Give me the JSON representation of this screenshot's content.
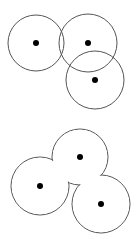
{
  "diagram": {
    "background": "#ffffff",
    "stroke_color": "#555555",
    "dot_color": "#000000",
    "top_figure": {
      "description": "three overlapping circles, each with a center dot",
      "circles": [
        {
          "cx": 36,
          "cy": 43,
          "r": 28
        },
        {
          "cx": 88,
          "cy": 43,
          "r": 29
        },
        {
          "cx": 95,
          "cy": 80,
          "r": 29
        }
      ]
    },
    "bottom_figure": {
      "description": "union outline of three circles (merged boundary), each with a center dot",
      "circles": [
        {
          "cx": 80,
          "cy": 157,
          "r": 28
        },
        {
          "cx": 40,
          "cy": 186,
          "r": 29
        },
        {
          "cx": 101,
          "cy": 204,
          "r": 29
        }
      ]
    }
  }
}
